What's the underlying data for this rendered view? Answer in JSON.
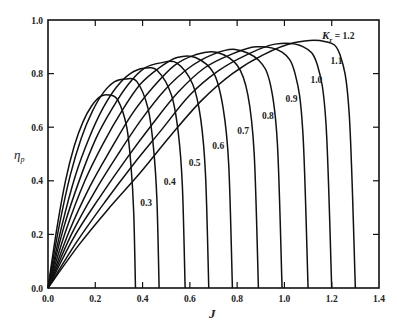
{
  "chart_data": {
    "type": "line",
    "title": "",
    "xlabel": "J",
    "ylabel": "η_p",
    "xlim": [
      0.0,
      1.4
    ],
    "ylim": [
      0.0,
      1.0
    ],
    "xticks": [
      "0.0",
      "0.2",
      "0.4",
      "0.6",
      "0.8",
      "1.0",
      "1.2",
      "1.4"
    ],
    "yticks": [
      "0.0",
      "0.2",
      "0.4",
      "0.6",
      "0.8",
      "1.0"
    ],
    "grid": false,
    "legend": "none (curves labeled inline)",
    "param_label": "K",
    "param_subscript": "r",
    "x_fraction_of_zero": [
      0,
      0.1,
      0.2,
      0.3,
      0.4,
      0.5,
      0.6,
      0.7,
      0.8,
      0.9,
      0.95,
      0.98,
      1.0
    ],
    "series": [
      {
        "name": "0.3",
        "J_zero": 0.37,
        "peak": {
          "J": 0.27,
          "eta": 0.72
        },
        "values": [
          0,
          0.22,
          0.4,
          0.53,
          0.62,
          0.68,
          0.715,
          0.72,
          0.7,
          0.6,
          0.45,
          0.28,
          0
        ],
        "label_pos": [
          0.39,
          0.305
        ]
      },
      {
        "name": "0.4",
        "J_zero": 0.47,
        "peak": {
          "J": 0.36,
          "eta": 0.79
        },
        "values": [
          0,
          0.23,
          0.42,
          0.56,
          0.66,
          0.73,
          0.77,
          0.78,
          0.77,
          0.67,
          0.52,
          0.33,
          0
        ],
        "label_pos": [
          0.49,
          0.385
        ]
      },
      {
        "name": "0.5",
        "J_zero": 0.58,
        "peak": {
          "J": 0.44,
          "eta": 0.83
        },
        "values": [
          0,
          0.23,
          0.42,
          0.56,
          0.67,
          0.75,
          0.8,
          0.82,
          0.81,
          0.72,
          0.58,
          0.38,
          0
        ],
        "label_pos": [
          0.595,
          0.455
        ]
      },
      {
        "name": "0.6",
        "J_zero": 0.68,
        "peak": {
          "J": 0.53,
          "eta": 0.86
        },
        "values": [
          0,
          0.23,
          0.41,
          0.56,
          0.67,
          0.76,
          0.82,
          0.84,
          0.84,
          0.76,
          0.63,
          0.42,
          0
        ],
        "label_pos": [
          0.695,
          0.52
        ]
      },
      {
        "name": "0.7",
        "J_zero": 0.78,
        "peak": {
          "J": 0.61,
          "eta": 0.88
        },
        "values": [
          0,
          0.22,
          0.4,
          0.54,
          0.66,
          0.76,
          0.82,
          0.86,
          0.86,
          0.8,
          0.67,
          0.46,
          0
        ],
        "label_pos": [
          0.8,
          0.575
        ]
      },
      {
        "name": "0.8",
        "J_zero": 0.89,
        "peak": {
          "J": 0.71,
          "eta": 0.895
        },
        "values": [
          0,
          0.21,
          0.38,
          0.52,
          0.65,
          0.75,
          0.83,
          0.87,
          0.88,
          0.83,
          0.72,
          0.5,
          0
        ],
        "label_pos": [
          0.905,
          0.63
        ]
      },
      {
        "name": "0.9",
        "J_zero": 0.99,
        "peak": {
          "J": 0.8,
          "eta": 0.905
        },
        "values": [
          0,
          0.2,
          0.36,
          0.5,
          0.63,
          0.74,
          0.82,
          0.87,
          0.89,
          0.85,
          0.76,
          0.54,
          0
        ],
        "label_pos": [
          1.005,
          0.695
        ]
      },
      {
        "name": "1.0",
        "J_zero": 1.1,
        "peak": {
          "J": 0.9,
          "eta": 0.915
        },
        "values": [
          0,
          0.19,
          0.34,
          0.48,
          0.61,
          0.73,
          0.82,
          0.87,
          0.9,
          0.88,
          0.8,
          0.58,
          0
        ],
        "label_pos": [
          1.11,
          0.765
        ]
      },
      {
        "name": "1.1",
        "J_zero": 1.2,
        "peak": {
          "J": 1.01,
          "eta": 0.92
        },
        "values": [
          0,
          0.17,
          0.32,
          0.46,
          0.59,
          0.72,
          0.81,
          0.87,
          0.91,
          0.9,
          0.83,
          0.61,
          0
        ],
        "label_pos": [
          1.195,
          0.835
        ]
      },
      {
        "name": "1.2",
        "J_zero": 1.3,
        "peak": {
          "J": 1.11,
          "eta": 0.925
        },
        "values": [
          0,
          0.16,
          0.3,
          0.43,
          0.57,
          0.7,
          0.8,
          0.87,
          0.915,
          0.92,
          0.87,
          0.65,
          0
        ],
        "label_pos": [
          1.185,
          0.935
        ]
      }
    ],
    "annotations": [
      "K_r = 1.2",
      "1.1",
      "1.0",
      "0.9",
      "0.8",
      "0.7",
      "0.6",
      "0.5",
      "0.4",
      "0.3"
    ]
  },
  "labels": {
    "ylabel_main": "η",
    "ylabel_sub": "p",
    "xlabel": "J",
    "k_main": "K",
    "k_sub": "r",
    "k_eq": " = 1.2"
  },
  "layout": {
    "plot": {
      "left": 48,
      "right": 379,
      "top": 20,
      "bottom": 288
    },
    "line_color": "#111111"
  }
}
